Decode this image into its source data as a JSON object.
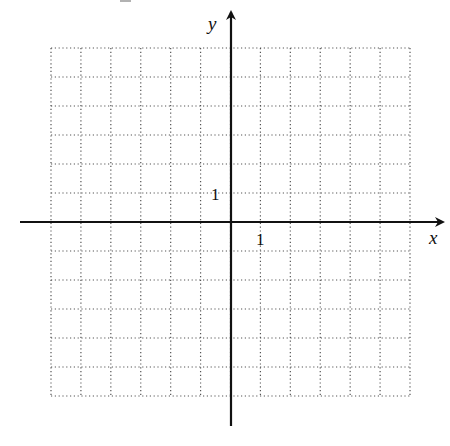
{
  "diagram": {
    "type": "coordinate-plane",
    "x_axis_label": "x",
    "y_axis_label": "y",
    "x_tick_label": "1",
    "y_tick_label": "1",
    "grid": {
      "columns": 12,
      "rows": 12,
      "x_range": [
        -6,
        6
      ],
      "y_range": [
        -6,
        6
      ],
      "line_style": "dotted"
    },
    "colors": {
      "axis": "#111111",
      "grid": "#555555",
      "background": "#ffffff"
    }
  }
}
